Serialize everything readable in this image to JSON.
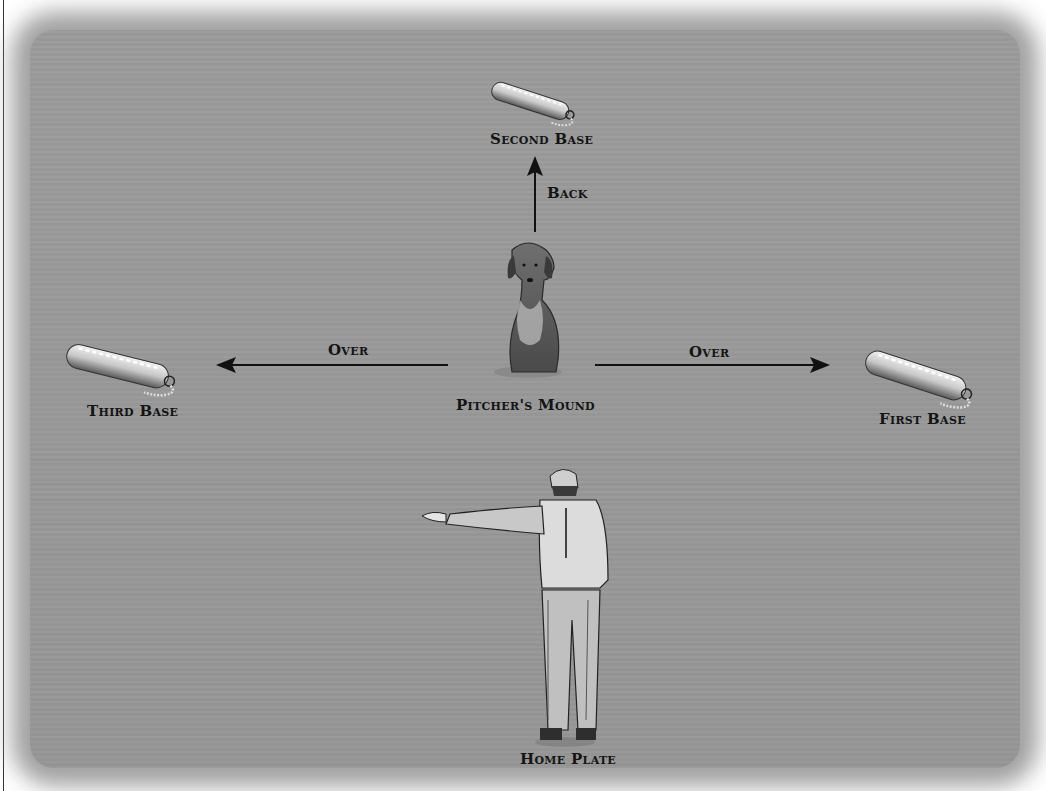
{
  "diagram": {
    "background_color": "#9c9c9c",
    "positions": {
      "second_base": {
        "label": "Second Base"
      },
      "third_base": {
        "label": "Third Base"
      },
      "first_base": {
        "label": "First Base"
      },
      "pitchers_mound": {
        "label": "Pitcher's Mound"
      },
      "home_plate": {
        "label": "Home Plate"
      }
    },
    "arrows": {
      "back": {
        "label": "Back",
        "direction": "up"
      },
      "over_left": {
        "label": "Over",
        "direction": "left"
      },
      "over_right": {
        "label": "Over",
        "direction": "right"
      }
    },
    "figures": {
      "dog": "sitting-retriever-icon",
      "handler": "handler-pointing-icon",
      "bumper": "training-bumper-icon"
    }
  }
}
